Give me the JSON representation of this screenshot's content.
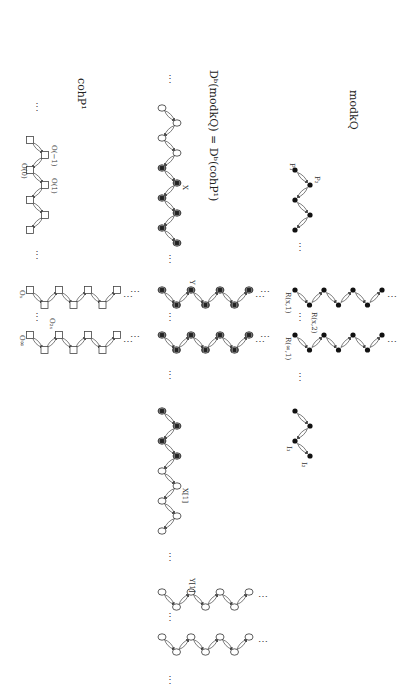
{
  "figure": {
    "orientation": "rotated-90-clockwise",
    "panels": [
      {
        "id": "modkQ",
        "title": "modkQ",
        "title_pos": [
          350,
          90
        ],
        "node_style": "dot",
        "components": [
          {
            "name": "preprojective",
            "type": "zigzag",
            "x_pair": [
              295,
              310
            ],
            "y_start": 170,
            "y_step": 15,
            "count": 5,
            "labels": [
              {
                "text": "P₁",
                "x": 290,
                "y": 163
              },
              {
                "text": "P₂",
                "x": 315,
                "y": 176
              }
            ]
          },
          {
            "name": "regular-tube-x",
            "type": "tube",
            "top_y": 290,
            "bottom_y": 305,
            "x_start": 295,
            "x_step": 29,
            "count": 4,
            "labels": [
              {
                "text": "R(x,1)",
                "x": 286,
                "y": 292
              },
              {
                "text": "R(x,2)",
                "x": 312,
                "y": 312
              }
            ]
          },
          {
            "name": "regular-tube-infinity",
            "type": "tube",
            "top_y": 335,
            "bottom_y": 350,
            "x_start": 295,
            "x_step": 29,
            "count": 4,
            "labels": [
              {
                "text": "R(∞,1)",
                "x": 286,
                "y": 337
              }
            ]
          },
          {
            "name": "preinjective",
            "type": "zigzag",
            "x_pair": [
              295,
              310
            ],
            "y_start": 411,
            "y_step": 15,
            "count": 4,
            "labels": [
              {
                "text": "I₁",
                "x": 287,
                "y": 446
              },
              {
                "text": "I₂",
                "x": 302,
                "y": 462
              }
            ]
          }
        ],
        "ellipses": [
          {
            "x": 300,
            "y": 250,
            "dir": "v"
          },
          {
            "x": 300,
            "y": 320,
            "dir": "v"
          },
          {
            "x": 300,
            "y": 380,
            "dir": "v"
          },
          {
            "x": 392,
            "y": 300,
            "dir": "h"
          },
          {
            "x": 392,
            "y": 345,
            "dir": "h"
          },
          {
            "x": 265,
            "y": 295,
            "dir": "h"
          },
          {
            "x": 265,
            "y": 340,
            "dir": "h"
          }
        ]
      },
      {
        "id": "Db",
        "title": "Dᵇ(modkQ) = Dᵇ(cohP¹)",
        "title_pos": [
          210,
          70
        ],
        "node_style": "double-box",
        "components": [
          {
            "name": "zigzag-upper",
            "type": "zigzag",
            "x_pair": [
              162,
              177
            ],
            "y_start": 108,
            "y_step": 15,
            "count": 10,
            "filled_from": 4,
            "labels": [
              {
                "text": "X",
                "x": 183,
                "y": 185
              }
            ]
          },
          {
            "name": "tube-upper-1",
            "type": "tube",
            "top_y": 290,
            "bottom_y": 305,
            "x_start": 162,
            "x_step": 29,
            "count": 4,
            "filled": true,
            "labels": [
              {
                "text": "Y",
                "x": 190,
                "y": 280
              }
            ]
          },
          {
            "name": "tube-upper-2",
            "type": "tube",
            "top_y": 335,
            "bottom_y": 350,
            "x_start": 162,
            "x_step": 29,
            "count": 4,
            "filled": true,
            "labels": []
          },
          {
            "name": "zigzag-lower",
            "type": "zigzag",
            "x_pair": [
              162,
              177
            ],
            "y_start": 411,
            "y_step": 15,
            "count": 9,
            "filled_until": 4,
            "labels": [
              {
                "text": "X[1]",
                "x": 183,
                "y": 488
              }
            ]
          },
          {
            "name": "tube-lower-1",
            "type": "tube",
            "top_y": 592,
            "bottom_y": 607,
            "x_start": 162,
            "x_step": 29,
            "count": 4,
            "filled": false,
            "labels": [
              {
                "text": "Y[1]",
                "x": 190,
                "y": 578
              }
            ]
          },
          {
            "name": "tube-lower-2",
            "type": "tube",
            "top_y": 637,
            "bottom_y": 652,
            "x_start": 162,
            "x_step": 29,
            "count": 4,
            "filled": false,
            "labels": []
          }
        ],
        "ellipses": [
          {
            "x": 170,
            "y": 82,
            "dir": "v"
          },
          {
            "x": 170,
            "y": 262,
            "dir": "v"
          },
          {
            "x": 170,
            "y": 320,
            "dir": "v"
          },
          {
            "x": 170,
            "y": 378,
            "dir": "v"
          },
          {
            "x": 170,
            "y": 560,
            "dir": "v"
          },
          {
            "x": 170,
            "y": 620,
            "dir": "v"
          },
          {
            "x": 170,
            "y": 683,
            "dir": "v"
          },
          {
            "x": 260,
            "y": 300,
            "dir": "h"
          },
          {
            "x": 260,
            "y": 345,
            "dir": "h"
          },
          {
            "x": 263,
            "y": 600,
            "dir": "h"
          },
          {
            "x": 263,
            "y": 645,
            "dir": "h"
          },
          {
            "x": 135,
            "y": 295,
            "dir": "h"
          },
          {
            "x": 135,
            "y": 340,
            "dir": "h"
          }
        ]
      },
      {
        "id": "cohP1",
        "title": "cohP¹",
        "title_pos": [
          78,
          78
        ],
        "node_style": "square",
        "components": [
          {
            "name": "line-bundles",
            "type": "zigzag",
            "x_pair": [
              30,
              45
            ],
            "y_start": 140,
            "y_step": 15,
            "count": 7,
            "labels": [
              {
                "text": "O(−1)",
                "x": 52,
                "y": 145
              },
              {
                "text": "O(0)",
                "x": 22,
                "y": 163
              },
              {
                "text": "O(1)",
                "x": 52,
                "y": 178
              }
            ]
          },
          {
            "name": "torsion-tube-x",
            "type": "tube",
            "top_y": 290,
            "bottom_y": 305,
            "x_start": 30,
            "x_step": 29,
            "count": 4,
            "labels": [
              {
                "text": "Oₓ",
                "x": 20,
                "y": 290
              },
              {
                "text": "O₂ₓ",
                "x": 50,
                "y": 318
              }
            ]
          },
          {
            "name": "torsion-tube-infinity",
            "type": "tube",
            "top_y": 335,
            "bottom_y": 350,
            "x_start": 30,
            "x_step": 29,
            "count": 4,
            "labels": [
              {
                "text": "O∞",
                "x": 20,
                "y": 335
              }
            ]
          }
        ],
        "ellipses": [
          {
            "x": 37,
            "y": 110,
            "dir": "v"
          },
          {
            "x": 37,
            "y": 258,
            "dir": "v"
          },
          {
            "x": 37,
            "y": 320,
            "dir": "v"
          },
          {
            "x": 128,
            "y": 300,
            "dir": "h"
          },
          {
            "x": 128,
            "y": 345,
            "dir": "h"
          }
        ]
      }
    ],
    "text": {
      "ellipsis": "⋮",
      "ellipsis_h": "⋯"
    }
  }
}
